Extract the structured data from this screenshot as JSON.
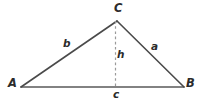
{
  "figure": {
    "type": "geometry-diagram",
    "shape": "triangle",
    "background_color": "#ffffff",
    "stroke_color": "#4a4a4a",
    "dashed_stroke_color": "#9a9a9a",
    "label_color": "#2b2b2b",
    "vertices": [
      {
        "name": "A",
        "label": "A",
        "x": 21,
        "y": 87
      },
      {
        "name": "B",
        "label": "B",
        "x": 184,
        "y": 87
      },
      {
        "name": "C",
        "label": "C",
        "x": 117,
        "y": 21
      }
    ],
    "sides": [
      {
        "name": "side-b",
        "label": "b",
        "from": "A",
        "to": "C"
      },
      {
        "name": "side-a",
        "label": "a",
        "from": "C",
        "to": "B"
      },
      {
        "name": "side-c",
        "label": "c",
        "from": "A",
        "to": "B"
      }
    ],
    "altitude": {
      "name": "height",
      "label": "h",
      "from": "C",
      "foot_x": 115,
      "foot_y": 87,
      "style": "dashed"
    }
  }
}
